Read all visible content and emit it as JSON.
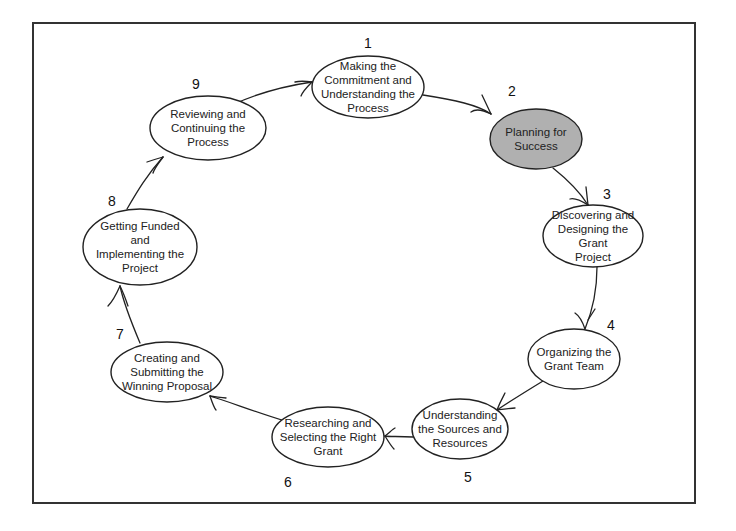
{
  "diagram": {
    "colors": {
      "stroke": "#222222",
      "frame": "#333333",
      "highlight_fill": "#b0b0b0",
      "node_fill": "#ffffff"
    },
    "steps": [
      {
        "number": "1",
        "label": "Making the\nCommitment and\nUnderstanding the\nProcess",
        "highlighted": false
      },
      {
        "number": "2",
        "label": "Planning for\nSuccess",
        "highlighted": true
      },
      {
        "number": "3",
        "label": "Discovering and\nDesigning the Grant\nProject",
        "highlighted": false
      },
      {
        "number": "4",
        "label": "Organizing the\nGrant Team",
        "highlighted": false
      },
      {
        "number": "5",
        "label": "Understanding\nthe Sources and\nResources",
        "highlighted": false
      },
      {
        "number": "6",
        "label": "Researching and\nSelecting the Right\nGrant",
        "highlighted": false
      },
      {
        "number": "7",
        "label": "Creating and\nSubmitting the\nWinning Proposal",
        "highlighted": false
      },
      {
        "number": "8",
        "label": "Getting Funded\nand\nImplementing the\nProject",
        "highlighted": false
      },
      {
        "number": "9",
        "label": "Reviewing and\nContinuing the\nProcess",
        "highlighted": false
      }
    ],
    "flow": [
      "1 → 2",
      "2 → 3",
      "3 → 4",
      "4 → 5",
      "5 → 6",
      "6 → 7",
      "7 → 8",
      "8 → 9",
      "9 → 1"
    ]
  }
}
